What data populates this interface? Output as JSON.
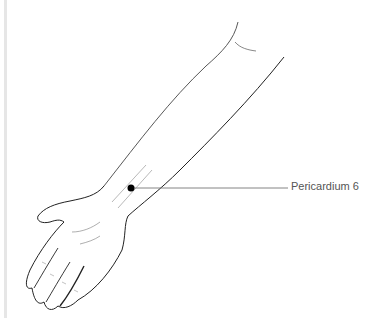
{
  "diagram": {
    "point_label": "Pericardium 6",
    "colors": {
      "line": "#222222",
      "leader": "#777777",
      "point": "#000000",
      "label": "#555555",
      "border": "#e6e6e6"
    }
  }
}
